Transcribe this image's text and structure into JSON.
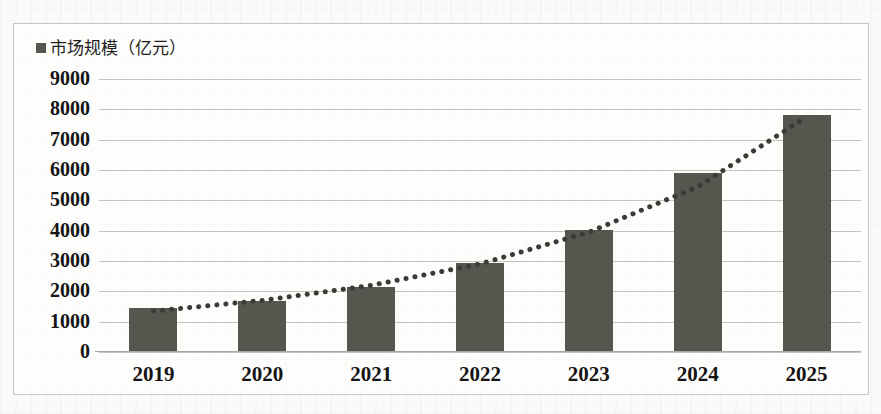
{
  "legend": {
    "marker": "square-marker",
    "label": "市场规模（亿元）"
  },
  "chart_data": {
    "type": "bar",
    "title": "",
    "subtitle": "",
    "xlabel": "",
    "ylabel": "",
    "categories": [
      "2019",
      "2020",
      "2021",
      "2022",
      "2023",
      "2024",
      "2025"
    ],
    "values": [
      1450,
      1680,
      2150,
      2950,
      4030,
      5900,
      7800
    ],
    "series": [
      {
        "name": "市场规模（亿元）",
        "values": [
          1450,
          1680,
          2150,
          2950,
          4030,
          5900,
          7800
        ]
      }
    ],
    "ylim": [
      0,
      9000
    ],
    "ytick_values": [
      9000,
      8000,
      7000,
      6000,
      5000,
      4000,
      3000,
      2000,
      1000,
      0
    ],
    "ytick_labels": [
      "9000",
      "8000",
      "7000",
      "6000",
      "5000",
      "4000",
      "3000",
      "2000",
      "1000",
      "0"
    ],
    "grid": true,
    "legend_position": "top-left",
    "bar_color": "#56554e",
    "gridline_color": "#c6c3be",
    "trendline": {
      "style": "dotted",
      "color": "#3b3a36",
      "type": "exponential",
      "points": [
        1350,
        1700,
        2200,
        2900,
        3950,
        5450,
        7750
      ]
    }
  }
}
